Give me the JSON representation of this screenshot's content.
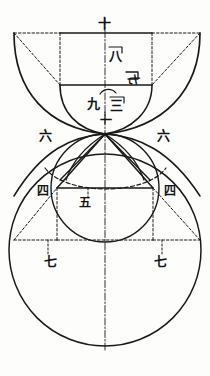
{
  "document": {
    "title": "古代几何圖",
    "kind": "geometric-figure",
    "ink_color": "#1a1a1a",
    "paper_color": "#fdfdfc"
  },
  "figure": {
    "center_node": {
      "x": 105,
      "y": 134
    },
    "axis": {
      "x": 105,
      "y_top": 18,
      "y_bottom": 352
    }
  },
  "labels": [
    {
      "id": "ten",
      "text": "十",
      "x": 105,
      "y": 24,
      "size": "lg",
      "rotate": false
    },
    {
      "id": "eight",
      "text": "八",
      "x": 116,
      "y": 57,
      "size": "lg",
      "rotate": false
    },
    {
      "id": "seven_top",
      "text": "七",
      "x": 133,
      "y": 80,
      "size": "sm",
      "rotate": true
    },
    {
      "id": "nine",
      "text": "九",
      "x": 94,
      "y": 104,
      "size": "lg",
      "rotate": false
    },
    {
      "id": "three",
      "text": "三",
      "x": 116,
      "y": 106,
      "size": "lg",
      "rotate": false
    },
    {
      "id": "one",
      "text": "一",
      "x": 107,
      "y": 122,
      "size": "md",
      "rotate": false
    },
    {
      "id": "six_left",
      "text": "六",
      "x": 46,
      "y": 136,
      "size": "lg",
      "rotate": false
    },
    {
      "id": "six_right",
      "text": "六",
      "x": 164,
      "y": 136,
      "size": "lg",
      "rotate": false
    },
    {
      "id": "four_left",
      "text": "四",
      "x": 43,
      "y": 191,
      "size": "md",
      "rotate": false
    },
    {
      "id": "four_right",
      "text": "四",
      "x": 170,
      "y": 191,
      "size": "md",
      "rotate": false
    },
    {
      "id": "five",
      "text": "五",
      "x": 85,
      "y": 203,
      "size": "md",
      "rotate": false
    },
    {
      "id": "seven_left",
      "text": "七",
      "x": 51,
      "y": 262,
      "size": "lg",
      "rotate": false
    },
    {
      "id": "seven_right",
      "text": "七",
      "x": 161,
      "y": 262,
      "size": "lg",
      "rotate": false
    }
  ],
  "numerals": {
    "one": "一",
    "three": "三",
    "four": "四",
    "five": "五",
    "six": "六",
    "seven": "七",
    "eight": "八",
    "nine": "九",
    "ten": "十"
  },
  "geometry": {
    "big_circle": {
      "cx": 105,
      "cy": 250,
      "r": 96
    },
    "mid_circle": {
      "cx": 105,
      "cy": 188,
      "r": 54
    },
    "outer_bowl": {
      "left_x": 14,
      "right_x": 200,
      "top_y": 33,
      "apex_y": 134
    },
    "inner_bowl": {
      "left_x": 60,
      "right_x": 152,
      "top_y": 85,
      "apex_y": 134
    },
    "top_frame": {
      "x1": 14,
      "x2": 200,
      "y": 33
    },
    "top_solid_bar": {
      "x1": 60,
      "x2": 152,
      "y": 33
    },
    "inner_bar": {
      "x1": 60,
      "x2": 152,
      "y": 85
    },
    "chord_four": {
      "x1": 57,
      "x2": 153,
      "y": 188
    },
    "chord_seven": {
      "x1": 14,
      "x2": 200,
      "y": 240
    }
  }
}
